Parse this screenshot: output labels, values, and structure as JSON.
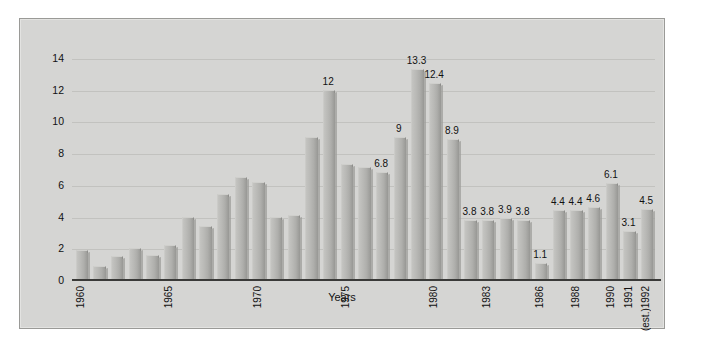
{
  "chart_data": {
    "type": "bar",
    "title": "",
    "xlabel": "Years",
    "ylabel": "",
    "ylim": [
      0,
      15
    ],
    "yticks": [
      0,
      2,
      4,
      6,
      8,
      10,
      12,
      14
    ],
    "grid": true,
    "legend": null,
    "categories": [
      "1960",
      "1961",
      "1962",
      "1963",
      "1964",
      "1965",
      "1966",
      "1967",
      "1968",
      "1969",
      "1970",
      "1971",
      "1972",
      "1973",
      "1974",
      "1975",
      "1976",
      "1977",
      "1978",
      "1979",
      "1980",
      "1981",
      "1982",
      "1983",
      "1984",
      "1985",
      "1986",
      "1987",
      "1988",
      "1989",
      "1990",
      "1991",
      "1992"
    ],
    "values": [
      1.9,
      0.9,
      1.5,
      2.0,
      1.6,
      2.2,
      4.0,
      3.4,
      5.4,
      6.5,
      6.2,
      4.0,
      4.1,
      9.0,
      12,
      7.3,
      7.1,
      6.8,
      9,
      13.3,
      12.4,
      8.9,
      3.8,
      3.8,
      3.9,
      3.8,
      1.1,
      4.4,
      4.4,
      4.6,
      6.1,
      3.1,
      4.5
    ],
    "value_labels": [
      "",
      "",
      "",
      "",
      "",
      "",
      "",
      "",
      "",
      "",
      "",
      "",
      "",
      "",
      "12",
      "",
      "",
      "6.8",
      "9",
      "13.3",
      "12.4",
      "8.9",
      "3.8",
      "3.8",
      "3.9",
      "3.8",
      "1.1",
      "4.4",
      "4.4",
      "4.6",
      "6.1",
      "3.1",
      "4.5"
    ],
    "tick_labels": [
      {
        "index": 0,
        "text": "1960"
      },
      {
        "index": 5,
        "text": "1965"
      },
      {
        "index": 10,
        "text": "1970"
      },
      {
        "index": 15,
        "text": "1975"
      },
      {
        "index": 20,
        "text": "1980"
      },
      {
        "index": 23,
        "text": "1983"
      },
      {
        "index": 26,
        "text": "1986"
      },
      {
        "index": 28,
        "text": "1988"
      },
      {
        "index": 30,
        "text": "1990"
      },
      {
        "index": 31,
        "text": "1991"
      },
      {
        "index": 32,
        "text": "(est.)1992"
      }
    ],
    "colors": {
      "bar_fill": "#b8b8b5",
      "bar_edge": "#8e8e8b",
      "plot_background": "#d5d5d3",
      "gridline": "#c2c2bf",
      "axis": "#3a3a38",
      "text": "#111111",
      "page_background": "#ffffff"
    }
  }
}
